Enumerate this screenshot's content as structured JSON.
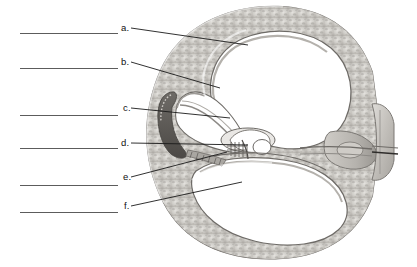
{
  "figure": {
    "orientation": "left-facing",
    "palette": {
      "background": "#ffffff",
      "bone_light": "#d8d6d2",
      "bone_mid": "#b9b6b1",
      "bone_dark": "#8e8b87",
      "membrane": "#9d9a96",
      "chamber_fill": "#ffffff",
      "dark_tissue": "#5d5a57",
      "outline": "#6e6b67",
      "leader_line": "#1a1a1a",
      "answer_line": "#5c5c5c",
      "text": "#111111"
    }
  },
  "labels": [
    {
      "id": "a",
      "letter": "a.",
      "letter_x": 121,
      "letter_y": 23,
      "leader": {
        "x1": 131,
        "y1": 28,
        "x2": 248,
        "y2": 45
      },
      "answer_line": {
        "x": 20,
        "y": 33,
        "width": 98
      }
    },
    {
      "id": "b",
      "letter": "b.",
      "letter_x": 121,
      "letter_y": 57,
      "leader": {
        "x1": 131,
        "y1": 62,
        "x2": 220,
        "y2": 88
      },
      "answer_line": {
        "x": 20,
        "y": 68,
        "width": 98
      }
    },
    {
      "id": "c",
      "letter": "c.",
      "letter_x": 123,
      "letter_y": 103,
      "leader": {
        "x1": 131,
        "y1": 108,
        "x2": 230,
        "y2": 118
      },
      "answer_line": {
        "x": 20,
        "y": 115,
        "width": 98
      }
    },
    {
      "id": "d",
      "letter": "d.",
      "letter_x": 121,
      "letter_y": 138,
      "leader": {
        "x1": 131,
        "y1": 143,
        "x2": 248,
        "y2": 145
      },
      "answer_line": {
        "x": 20,
        "y": 148,
        "width": 98
      }
    },
    {
      "id": "e",
      "letter": "e.",
      "letter_x": 123,
      "letter_y": 172,
      "leader": {
        "x1": 131,
        "y1": 177,
        "x2": 227,
        "y2": 152
      },
      "answer_line": {
        "x": 20,
        "y": 185,
        "width": 98
      }
    },
    {
      "id": "f",
      "letter": "f.",
      "letter_x": 124,
      "letter_y": 201,
      "leader": {
        "x1": 131,
        "y1": 206,
        "x2": 242,
        "y2": 182
      },
      "answer_line": {
        "x": 20,
        "y": 212,
        "width": 98
      }
    }
  ]
}
